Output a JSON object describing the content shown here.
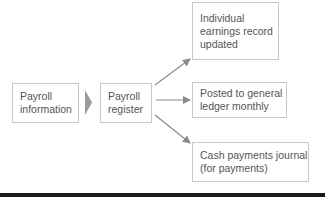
{
  "diagram": {
    "source": {
      "lines": [
        "Payroll",
        "information"
      ]
    },
    "register": {
      "lines": [
        "Payroll",
        "register"
      ]
    },
    "outputs": [
      {
        "lines": [
          "Individual",
          "earnings record",
          "updated"
        ]
      },
      {
        "lines": [
          "Posted to general",
          "ledger monthly"
        ]
      },
      {
        "lines": [
          "Cash payments journal",
          "(for payments)"
        ]
      }
    ],
    "colors": {
      "box_border": "#c8c8c8",
      "text": "#555555",
      "arrow": "#8a8a8a",
      "chevron": "#9a9a9a",
      "rule": "#1a1a1a"
    }
  }
}
